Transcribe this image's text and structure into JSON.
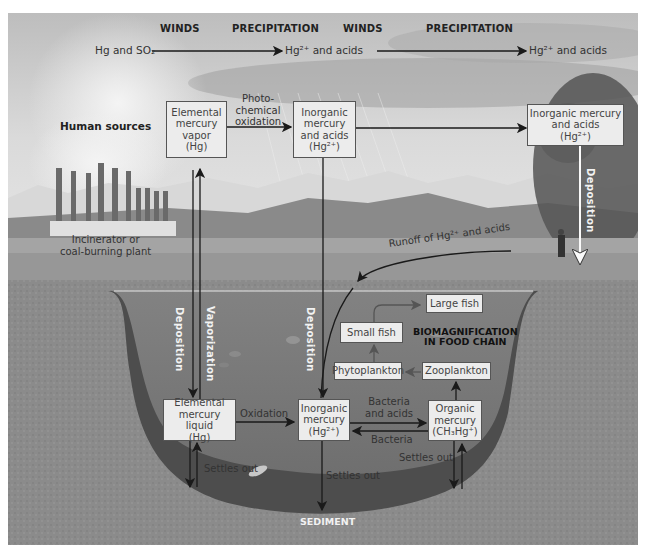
{
  "top_row": {
    "winds_1": "WINDS",
    "precipitation_1": "PRECIPITATION",
    "winds_2": "WINDS",
    "precipitation_2": "PRECIPITATION",
    "source_emission": "Hg and SO₂",
    "emission_result_1": "Hg²⁺ and acids",
    "emission_result_2": "Hg²⁺ and acids"
  },
  "atmosphere": {
    "human_sources": "Human sources",
    "plant_label": "Incinerator or\ncoal-burning plant",
    "photo_oxidation": "Photo-\nchemical\noxidation",
    "vapor_box": "Elemental\nmercury\nvapor\n(Hg)",
    "inorganic_box": "Inorganic\nmercury\nand acids\n(Hg²⁺)",
    "inorganic_far_box": "Inorganic mercury\nand acids\n(Hg²⁺)",
    "deposition_far": "Deposition",
    "runoff": "Runoff of Hg²⁺ and acids"
  },
  "water": {
    "deposition_left": "Deposition",
    "vaporization": "Vaporization",
    "deposition_center": "Deposition",
    "food_chain": {
      "title": "BIOMAGNIFICATION\nIN FOOD CHAIN",
      "large_fish": "Large fish",
      "small_fish": "Small fish",
      "phytoplankton": "Phytoplankton",
      "zooplankton": "Zooplankton"
    },
    "liquid_box": "Elemental\nmercury liquid\n(Hg)",
    "oxidation": "Oxidation",
    "inorganic_lower_box": "Inorganic\nmercury\n(Hg²⁺)",
    "bacteria_and_acids": "Bacteria\nand acids",
    "bacteria": "Bacteria",
    "organic_box": "Organic\nmercury\n(CH₃Hg⁺)",
    "settles_out_left": "Settles out",
    "settles_out_center": "Settles out",
    "settles_out_right": "Settles out",
    "sediment": "SEDIMENT"
  },
  "colors": {
    "sky_top": "#c8c8c8",
    "sky_bottom": "#e2e2e2",
    "mountains": "#9a9a9a",
    "land": "#8e8e8e",
    "water": "#7b7b7b",
    "sediment": "#4e4e4e",
    "ground": "#8a8a8a",
    "box_fill": "#ececec",
    "arrow": "#1a1a1a"
  }
}
